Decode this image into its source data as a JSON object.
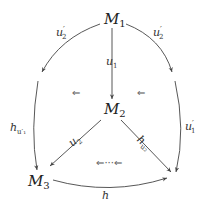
{
  "diagram": {
    "type": "commutative-diagram",
    "nodes": {
      "m1": {
        "base": "M",
        "sub": "1"
      },
      "m2": {
        "base": "M",
        "sub": "2"
      },
      "m3": {
        "base": "M",
        "sub": "3"
      }
    },
    "edges": [
      {
        "id": "u2prime-left",
        "from": "M1",
        "to": "left-arc",
        "label_base": "u",
        "label_sub": "2",
        "label_prime": "′"
      },
      {
        "id": "u2prime-right",
        "from": "M1",
        "to": "right-arc",
        "label_base": "u",
        "label_sub": "2",
        "label_prime": "′"
      },
      {
        "id": "u1",
        "from": "M1",
        "to": "M2",
        "label_base": "u",
        "label_sub": "1"
      },
      {
        "id": "h-u1prime",
        "from": "left-arc",
        "to": "M3",
        "label_base": "h",
        "label_sub": "u′₁"
      },
      {
        "id": "u1prime",
        "from": "right-arc",
        "to": "bottom-right",
        "label_base": "u",
        "label_sub": "1",
        "label_prime": "′"
      },
      {
        "id": "u2",
        "from": "M2",
        "to": "M3",
        "label_base": "u",
        "label_sub": "2"
      },
      {
        "id": "h-u2",
        "from": "M2",
        "to": "bottom-right",
        "label_base": "h",
        "label_sub": "u₂"
      },
      {
        "id": "h",
        "from": "M3",
        "to": "bottom-right",
        "label_base": "h"
      }
    ],
    "two_cells": {
      "left": "⇐",
      "right": "⇐",
      "bottom": "⇐···⇐"
    }
  }
}
